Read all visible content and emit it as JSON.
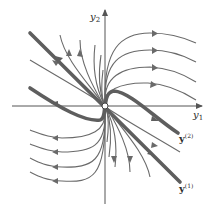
{
  "diagram": {
    "type": "phase-portrait",
    "colors": {
      "trajectory": "#6a6a6a",
      "eigen_line": "#5e5e5e",
      "axis": "#555555",
      "background": "#ffffff",
      "label": "#2a2a2a"
    },
    "axes": {
      "x": {
        "name": "y",
        "subscript": "1"
      },
      "y": {
        "name": "y",
        "subscript": "2"
      }
    },
    "eigen_labels": [
      {
        "name": "y",
        "superscript": "(2)"
      },
      {
        "name": "y",
        "superscript": "(1)"
      }
    ],
    "origin_marker": "open-circle"
  }
}
